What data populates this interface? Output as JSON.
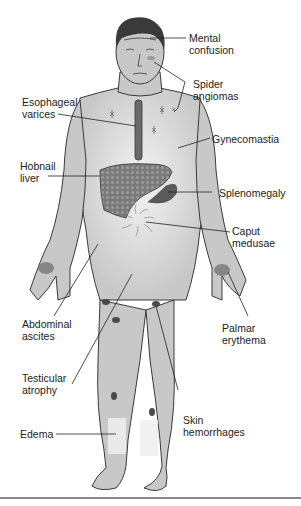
{
  "figure": {
    "type": "anatomical-diagram",
    "colors": {
      "skin": "#c8c8c8",
      "outline": "#3a3a3a",
      "hair": "#3a3a3a",
      "liver": "#7c7c7c",
      "spleen": "#5a5a5a",
      "ascites_glow": "#f2f2f2",
      "hemorrhage": "#4a4a4a",
      "rule": "#8a8a8a"
    }
  },
  "labels": [
    {
      "id": "mental-confusion",
      "text": "Mental\nconfusion"
    },
    {
      "id": "spider-angiomas",
      "text": "Spider\nangiomas"
    },
    {
      "id": "esophageal-varices",
      "text": "Esophageal\nvarices"
    },
    {
      "id": "gynecomastia",
      "text": "Gynecomastia"
    },
    {
      "id": "hobnail-liver",
      "text": "Hobnail\nliver"
    },
    {
      "id": "splenomegaly",
      "text": "Splenomegaly"
    },
    {
      "id": "caput-medusae",
      "text": "Caput\nmedusae"
    },
    {
      "id": "abdominal-ascites",
      "text": "Abdominal\nascites"
    },
    {
      "id": "palmar-erythema",
      "text": "Palmar\nerythema"
    },
    {
      "id": "testicular-atrophy",
      "text": "Testicular\natrophy"
    },
    {
      "id": "skin-hemorrhages",
      "text": "Skin\nhemorrhages"
    },
    {
      "id": "edema",
      "text": "Edema"
    }
  ]
}
